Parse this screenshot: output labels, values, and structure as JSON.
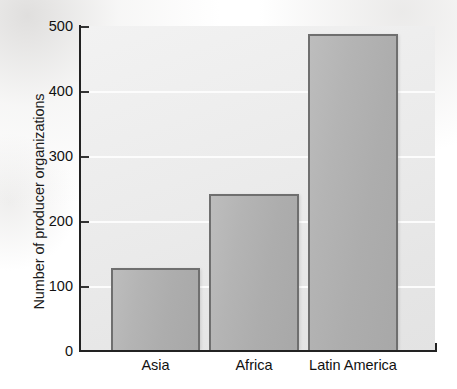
{
  "chart_data": {
    "type": "bar",
    "title": "",
    "subtitle": "",
    "xlabel": "",
    "ylabel": "Number of producer organizations",
    "categories": [
      "Asia",
      "Africa",
      "Latin America"
    ],
    "values": [
      128,
      241,
      488
    ],
    "series": [
      {
        "name": "Number of producer organizations",
        "values": [
          128,
          241,
          488
        ]
      }
    ],
    "ylim": [
      0,
      500
    ],
    "yticks": [
      0,
      100,
      200,
      300,
      400,
      500
    ],
    "ytick_labels": [
      "0",
      "100",
      "200",
      "300",
      "400",
      "500"
    ],
    "gridlines": {
      "horizontal": true,
      "vertical": false,
      "values": [
        100,
        200,
        300,
        400
      ]
    },
    "legend": {
      "visible": false,
      "position": "none",
      "entries": []
    },
    "annotations": [],
    "colors": {
      "bar_fill": "#b0b0b0",
      "bar_edge": "#6f6f6f",
      "plot_background": "#ebebeb",
      "gridline": "#fcfcfc",
      "axis": "#222222",
      "text": "#111111"
    }
  },
  "axes": {
    "y_title": "Number of producer organizations",
    "y_ticks": [
      {
        "label": "500",
        "value": 500
      },
      {
        "label": "400",
        "value": 400
      },
      {
        "label": "300",
        "value": 300
      },
      {
        "label": "200",
        "value": 200
      },
      {
        "label": "100",
        "value": 100
      },
      {
        "label": "0",
        "value": 0
      }
    ],
    "x_ticks": [
      {
        "label": "Asia"
      },
      {
        "label": "Africa"
      },
      {
        "label": "Latin America"
      }
    ]
  }
}
